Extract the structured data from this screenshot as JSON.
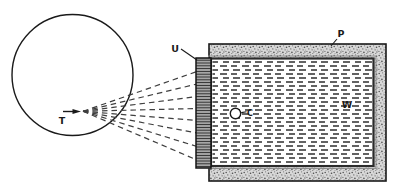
{
  "labels": {
    "t": "T",
    "u": "U",
    "p": "P",
    "w": "W",
    "c": "C"
  },
  "colors": {
    "background": "#ffffff",
    "line": "#1a1a1a",
    "ray": "#3f3f3f",
    "stipple_bg": "#d8d8d8",
    "stipple_dot": "#5a5a5a",
    "hatch_bg": "#ababab",
    "hatch_line": "#2e2e2e",
    "water_dash": "#3d3d3d"
  }
}
